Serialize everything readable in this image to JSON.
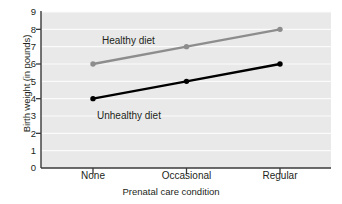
{
  "chart_data": {
    "type": "line",
    "title": "",
    "xlabel": "Prenatal care condition",
    "ylabel": "Birth weight (in pounds)",
    "categories": [
      "None",
      "Occasional",
      "Regular"
    ],
    "ylim": [
      0,
      9
    ],
    "yticks": [
      0,
      1,
      2,
      3,
      4,
      5,
      6,
      7,
      8,
      9
    ],
    "ytick_labels": [
      "0",
      "1",
      "2",
      "3",
      "4",
      "5",
      "6",
      "7",
      "8",
      "9"
    ],
    "grid": true,
    "grid_axis": "y",
    "legend_position": "inline-annotations",
    "plot_background": "#e9e9e9",
    "grid_color": "#fbfbfb",
    "axis_color": "#3a3a3a",
    "series": [
      {
        "name": "Healthy diet",
        "values": [
          6,
          7,
          8
        ],
        "color": "#8d8d8d",
        "marker": "circle"
      },
      {
        "name": "Unhealthy diet",
        "values": [
          4,
          5,
          6
        ],
        "color": "#000000",
        "marker": "circle"
      }
    ],
    "annotations": [
      {
        "text": "Healthy diet",
        "series": "Healthy diet"
      },
      {
        "text": "Unhealthy diet",
        "series": "Unhealthy diet"
      }
    ]
  }
}
